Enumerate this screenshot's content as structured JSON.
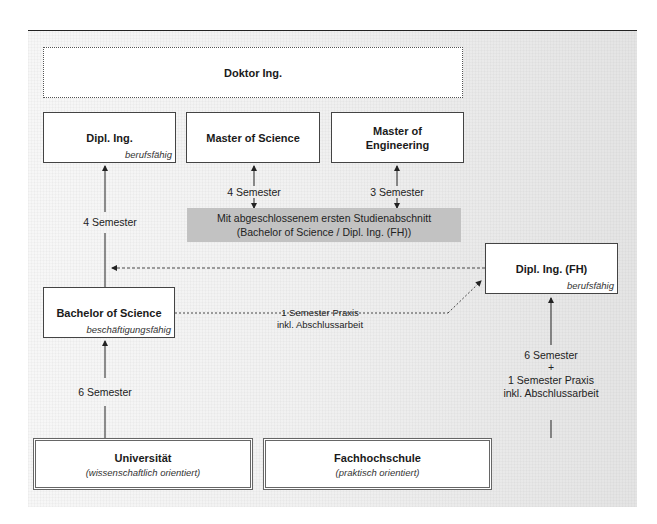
{
  "diagram": {
    "top_box": {
      "title": "Doktor Ing."
    },
    "upper_boxes": [
      {
        "title": "Dipl. Ing.",
        "subtitle": "berufsfähig"
      },
      {
        "title": "Master of Science"
      },
      {
        "title": "Master of Engineering",
        "title_lines": [
          "Master of",
          "Engineering"
        ]
      }
    ],
    "prerequisite_band": {
      "line1": "Mit abgeschlossenem ersten Studienabschnitt",
      "line2": "(Bachelor of Science / Dipl. Ing. (FH))"
    },
    "edge_labels": {
      "bachelor_to_diplom": "4 Semester",
      "band_to_master_science": "4 Semester",
      "band_to_master_engineering": "3 Semester",
      "bachelor_to_fh_line1": "1 Semester Praxis",
      "bachelor_to_fh_line2": "inkl. Abschlussarbeit",
      "uni_to_bachelor": "6 Semester",
      "fh_to_diplom_fh_line1": "6 Semester",
      "fh_to_diplom_fh_plus": "+",
      "fh_to_diplom_fh_line2": "1 Semester Praxis",
      "fh_to_diplom_fh_line3": "inkl. Abschlussarbeit"
    },
    "bachelor_box": {
      "title": "Bachelor of Science",
      "subtitle": "beschäftigungsfähig"
    },
    "diplom_fh_box": {
      "title": "Dipl. Ing. (FH)",
      "subtitle": "berufsfähig"
    },
    "institutions": [
      {
        "title": "Universität",
        "subtitle": "(wissenschaftlich orientiert)"
      },
      {
        "title": "Fachhochschule",
        "subtitle": "(praktisch orientiert)"
      }
    ],
    "colors": {
      "band": "#c2c2c2",
      "line": "#222222",
      "panel_left": "#f7f7f7",
      "panel_right": "#e4e4e4"
    }
  }
}
